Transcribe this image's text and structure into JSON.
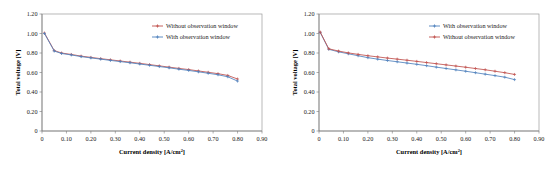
{
  "figure": {
    "panel_count": 2
  },
  "chart_data": [
    {
      "type": "line",
      "title": "",
      "xlabel": "Current density [A/cm²]",
      "ylabel": "Total voltage [V]",
      "xlim": [
        0,
        0.9
      ],
      "ylim": [
        0,
        1.2
      ],
      "xticks": [
        "0",
        "0.10",
        "0.20",
        "0.30",
        "0.40",
        "0.50",
        "0.60",
        "0.70",
        "0.80",
        "0.90"
      ],
      "xtick_values": [
        0,
        0.1,
        0.2,
        0.3,
        0.4,
        0.5,
        0.6,
        0.7,
        0.8,
        0.9
      ],
      "yticks": [
        "0",
        "0.20",
        "0.40",
        "0.60",
        "0.80",
        "1.00",
        "1.20"
      ],
      "ytick_values": [
        0,
        0.2,
        0.4,
        0.6,
        0.8,
        1.0,
        1.2
      ],
      "grid": false,
      "legend_position": "top-right",
      "x": [
        0.01,
        0.05,
        0.08,
        0.12,
        0.16,
        0.2,
        0.24,
        0.28,
        0.32,
        0.36,
        0.4,
        0.44,
        0.48,
        0.52,
        0.56,
        0.6,
        0.64,
        0.68,
        0.72,
        0.76,
        0.8
      ],
      "series": [
        {
          "name": "Without observation window",
          "color": "#c0504d",
          "values": [
            1.005,
            0.825,
            0.8,
            0.785,
            0.768,
            0.755,
            0.742,
            0.73,
            0.718,
            0.706,
            0.694,
            0.681,
            0.668,
            0.655,
            0.642,
            0.63,
            0.616,
            0.602,
            0.588,
            0.57,
            0.533
          ]
        },
        {
          "name": "With observation window",
          "color": "#4f81bd",
          "values": [
            1.0,
            0.82,
            0.795,
            0.78,
            0.763,
            0.75,
            0.737,
            0.724,
            0.712,
            0.7,
            0.687,
            0.674,
            0.661,
            0.648,
            0.634,
            0.621,
            0.607,
            0.592,
            0.577,
            0.556,
            0.512
          ]
        }
      ]
    },
    {
      "type": "line",
      "title": "",
      "xlabel": "Current density [A/cm²]",
      "ylabel": "Total voltage [V]",
      "xlim": [
        0,
        0.9
      ],
      "ylim": [
        0,
        1.2
      ],
      "xticks": [
        "0",
        "0.10",
        "0.20",
        "0.30",
        "0.40",
        "0.50",
        "0.60",
        "0.70",
        "0.80",
        "0.90"
      ],
      "xtick_values": [
        0,
        0.1,
        0.2,
        0.3,
        0.4,
        0.5,
        0.6,
        0.7,
        0.8,
        0.9
      ],
      "yticks": [
        "0",
        "0.20",
        "0.40",
        "0.60",
        "0.80",
        "1.00",
        "1.20"
      ],
      "ytick_values": [
        0,
        0.2,
        0.4,
        0.6,
        0.8,
        1.0,
        1.2
      ],
      "grid": false,
      "legend_position": "top-right",
      "x": [
        0.005,
        0.04,
        0.08,
        0.12,
        0.16,
        0.2,
        0.24,
        0.28,
        0.32,
        0.36,
        0.4,
        0.44,
        0.48,
        0.52,
        0.56,
        0.6,
        0.64,
        0.68,
        0.72,
        0.76,
        0.8
      ],
      "series": [
        {
          "name": "With observation window",
          "color": "#4f81bd",
          "values": [
            1.01,
            0.838,
            0.812,
            0.792,
            0.772,
            0.752,
            0.737,
            0.723,
            0.71,
            0.697,
            0.684,
            0.67,
            0.655,
            0.641,
            0.627,
            0.613,
            0.598,
            0.583,
            0.568,
            0.552,
            0.527
          ]
        },
        {
          "name": "Without observation window",
          "color": "#c0504d",
          "values": [
            1.015,
            0.843,
            0.82,
            0.801,
            0.786,
            0.772,
            0.76,
            0.748,
            0.737,
            0.726,
            0.714,
            0.702,
            0.69,
            0.678,
            0.666,
            0.654,
            0.641,
            0.628,
            0.613,
            0.598,
            0.58
          ]
        }
      ]
    }
  ]
}
